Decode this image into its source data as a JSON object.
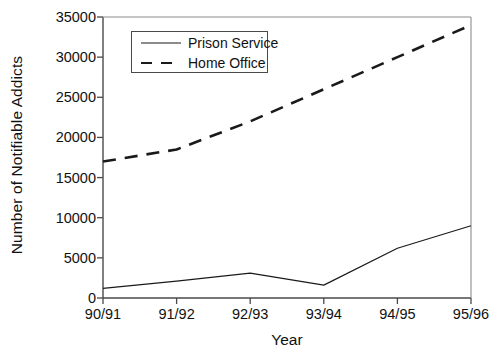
{
  "chart_data": {
    "type": "line",
    "title": "",
    "xlabel": "Year",
    "ylabel": "Number of Notifiable Addicts",
    "categories": [
      "90/91",
      "91/92",
      "92/93",
      "93/94",
      "94/95",
      "95/96"
    ],
    "ylim": [
      0,
      35000
    ],
    "yticks": [
      0,
      5000,
      10000,
      15000,
      20000,
      25000,
      30000,
      35000
    ],
    "ytick_labels": [
      "0",
      "5000",
      "10000",
      "15000",
      "20000",
      "25000",
      "30000",
      "35000"
    ],
    "grid": false,
    "legend_position": "upper left",
    "series": [
      {
        "name": "Prison Service",
        "style": "solid",
        "color": "#1a1a1a",
        "values": [
          1200,
          2100,
          3100,
          1600,
          6200,
          9000
        ]
      },
      {
        "name": "Home Office",
        "style": "dashed",
        "color": "#1a1a1a",
        "values": [
          17000,
          18500,
          22000,
          26000,
          30000,
          34000
        ]
      }
    ]
  },
  "legend": {
    "entries": [
      {
        "label": "Prison Service"
      },
      {
        "label": "Home Office"
      }
    ]
  }
}
